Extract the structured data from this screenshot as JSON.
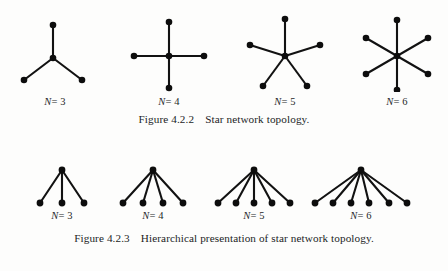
{
  "page": {
    "background_color": "#fdfdfc",
    "ink_color": "#121212"
  },
  "figures": [
    {
      "id": "figure-4-2-2",
      "caption_number": "Figure 4.2.2",
      "caption_text": "Star network topology.",
      "diagram_style": "star",
      "items": [
        {
          "label_var": "N",
          "label_eq": "= 3",
          "n": 3
        },
        {
          "label_var": "N",
          "label_eq": "= 4",
          "n": 4
        },
        {
          "label_var": "N",
          "label_eq": "= 5",
          "n": 5
        },
        {
          "label_var": "N",
          "label_eq": "= 6",
          "n": 6
        }
      ]
    },
    {
      "id": "figure-4-2-3",
      "caption_number": "Figure 4.2.3",
      "caption_text": "Hierarchical presentation of star network topology.",
      "diagram_style": "hierarchical",
      "items": [
        {
          "label_var": "N",
          "label_eq": "= 3",
          "n": 3
        },
        {
          "label_var": "N",
          "label_eq": "= 4",
          "n": 4
        },
        {
          "label_var": "N",
          "label_eq": "= 5",
          "n": 5
        },
        {
          "label_var": "N",
          "label_eq": "= 6",
          "n": 6
        }
      ]
    }
  ],
  "graph_data": {
    "star_topology": {
      "description": "Star network topology: one central hub node connected by a spoke to each of N peripheral nodes.",
      "diagrams": [
        {
          "n": 3,
          "center": [
            52,
            58
          ],
          "spoke_angles_deg": [
            90,
            210,
            330
          ],
          "spoke_length": 33
        },
        {
          "n": 4,
          "center": [
            168,
            56
          ],
          "spoke_angles_deg": [
            90,
            0,
            270,
            180
          ],
          "spoke_length": 34
        },
        {
          "n": 5,
          "center": [
            284,
            56
          ],
          "spoke_angles_deg": [
            90,
            18,
            306,
            234,
            162
          ],
          "spoke_length": 37
        },
        {
          "n": 6,
          "center": [
            396,
            56
          ],
          "spoke_angles_deg": [
            90,
            30,
            330,
            270,
            210,
            150
          ],
          "spoke_length": 36
        }
      ]
    },
    "hierarchical_topology": {
      "description": "Hierarchical presentation: a single apex (hub) node at top with N straight edges fanning down to N leaf nodes arranged on a horizontal baseline.",
      "diagrams": [
        {
          "n": 3,
          "apex": [
            62,
            170
          ],
          "leaf_baseline_y": 207,
          "leaf_spread": 44
        },
        {
          "n": 4,
          "apex": [
            152,
            170
          ],
          "leaf_baseline_y": 207,
          "leaf_spread": 60
        },
        {
          "n": 5,
          "apex": [
            253,
            170
          ],
          "leaf_baseline_y": 207,
          "leaf_spread": 74
        },
        {
          "n": 6,
          "apex": [
            361,
            170
          ],
          "leaf_baseline_y": 207,
          "leaf_spread": 92
        }
      ]
    }
  }
}
